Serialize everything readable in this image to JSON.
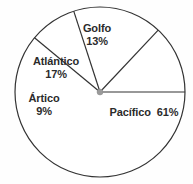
{
  "chart_data": {
    "type": "pie",
    "title": "",
    "subtitle": "",
    "xlabel": "",
    "ylabel": "",
    "legend_position": "none",
    "grid": false,
    "units": "percent",
    "total": 100,
    "categories": [
      "Golfo",
      "Pacífico",
      "Ártico",
      "Atlántico"
    ],
    "values": [
      13,
      61,
      9,
      17
    ],
    "labels": [
      "13%",
      "61%",
      "9%",
      "17%"
    ],
    "slices": [
      {
        "name": "Golfo",
        "value": 13,
        "percent_label": "13%",
        "label_layout": "stacked",
        "start_angle": 313.2,
        "end_angle": 360.0,
        "color": "#ffffff",
        "stroke": "#333333"
      },
      {
        "name": "Pacífico",
        "value": 61,
        "percent_label": "61%",
        "label_layout": "inline",
        "start_angle": 0.0,
        "end_angle": 219.6,
        "color": "#ffffff",
        "stroke": "#333333"
      },
      {
        "name": "Ártico",
        "value": 9,
        "percent_label": "9%",
        "label_layout": "stacked",
        "start_angle": 219.6,
        "end_angle": 252.0,
        "color": "#ffffff",
        "stroke": "#333333"
      },
      {
        "name": "Atlántico",
        "value": 17,
        "percent_label": "17%",
        "label_layout": "stacked",
        "start_angle": 252.0,
        "end_angle": 313.2,
        "color": "#ffffff",
        "stroke": "#333333"
      }
    ],
    "geometry": {
      "center_x": 100,
      "center_y": 92,
      "radius": 85,
      "hub_radius": 3
    },
    "style": {
      "background": "#fefefe",
      "outline_color": "#333333",
      "divider_color": "#333333",
      "hub_color": "#9a9a9a",
      "label_color": "#2b2b2b"
    }
  }
}
